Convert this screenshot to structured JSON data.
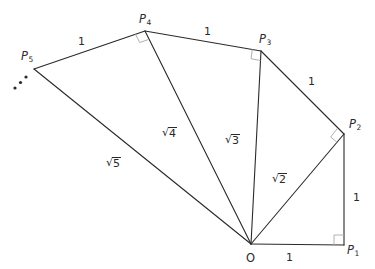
{
  "diagram": {
    "colors": {
      "line": "#2a2a2a",
      "right_angle_mark": "#a8a8a8",
      "background": "#ffffff"
    },
    "points": {
      "O": {
        "label": "O",
        "sub": "",
        "x": 251,
        "y": 244
      },
      "P1": {
        "label": "P",
        "sub": "1",
        "x": 344,
        "y": 245
      },
      "P2": {
        "label": "P",
        "sub": "2",
        "x": 344,
        "y": 134
      },
      "P3": {
        "label": "P",
        "sub": "3",
        "x": 261,
        "y": 51
      },
      "P4": {
        "label": "P",
        "sub": "4",
        "x": 145,
        "y": 31
      },
      "P5": {
        "label": "P",
        "sub": "5",
        "x": 34,
        "y": 69
      }
    },
    "outer_edges": [
      {
        "from": "P1",
        "to": "P2",
        "length_label": "1"
      },
      {
        "from": "P2",
        "to": "P3",
        "length_label": "1"
      },
      {
        "from": "P3",
        "to": "P4",
        "length_label": "1"
      },
      {
        "from": "P4",
        "to": "P5",
        "length_label": "1"
      },
      {
        "from": "O",
        "to": "P1",
        "length_label": "1"
      }
    ],
    "radii": [
      {
        "to": "P2",
        "radicand": "2",
        "label": "√2"
      },
      {
        "to": "P3",
        "radicand": "3",
        "label": "√3"
      },
      {
        "to": "P4",
        "radicand": "4",
        "label": "√4"
      },
      {
        "to": "P5",
        "radicand": "5",
        "label": "√5"
      }
    ],
    "right_angles_at": [
      "P1",
      "P2",
      "P3",
      "P4"
    ],
    "continuation": "…",
    "labels": {
      "O": "O",
      "P": "P",
      "sub1": "1",
      "sub2": "2",
      "sub3": "3",
      "sub4": "4",
      "sub5": "5",
      "edge_O_P1": "1",
      "edge_P1_P2": "1",
      "edge_P2_P3": "1",
      "edge_P3_P4": "1",
      "edge_P4_P5": "1",
      "rad_symbol": "√",
      "r2": "2",
      "r3": "3",
      "r4": "4",
      "r5": "5"
    }
  }
}
